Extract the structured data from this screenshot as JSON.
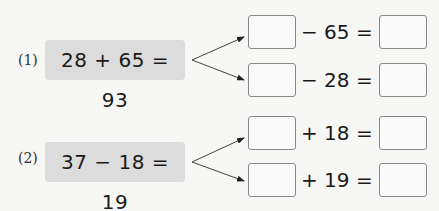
{
  "problems": [
    {
      "label": "(1)",
      "equation": "28 + 65 = 93",
      "rows": [
        {
          "left_blank": "",
          "op_text": "− 65 =",
          "right_blank": ""
        },
        {
          "left_blank": "",
          "op_text": "− 28 =",
          "right_blank": ""
        }
      ]
    },
    {
      "label": "(2)",
      "equation": "37 − 18 = 19",
      "rows": [
        {
          "left_blank": "",
          "op_text": "+ 18 =",
          "right_blank": ""
        },
        {
          "left_blank": "",
          "op_text": "+ 19 =",
          "right_blank": ""
        }
      ]
    }
  ],
  "colors": {
    "background": "#f7f7f5",
    "equation_box": "#dcdcdc",
    "blank_border": "#888888",
    "text": "#1a1a1a"
  }
}
